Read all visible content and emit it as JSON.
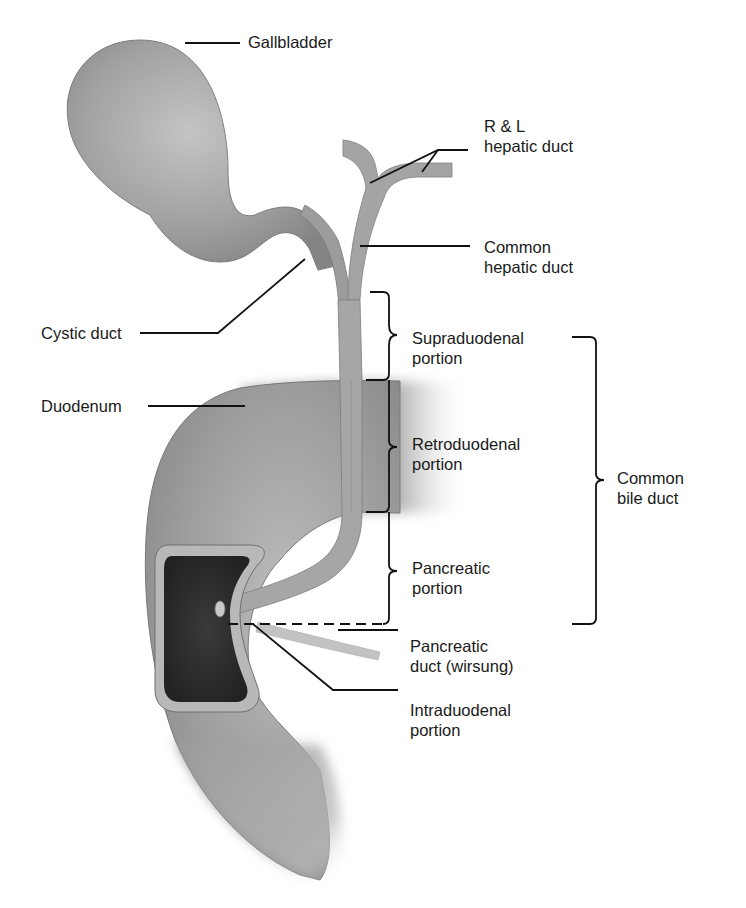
{
  "figure": {
    "type": "anatomical-diagram",
    "colors": {
      "background": "#ffffff",
      "organ_mid": "#9a9a9a",
      "organ_light": "#bdbdbd",
      "organ_dark": "#7a7a7a",
      "papilla_dark": "#2c2c2c",
      "papilla_rim": "#b8b8b8",
      "leader_line": "#111111",
      "text": "#1a1a1a"
    }
  },
  "labels": {
    "gallbladder": {
      "lines": [
        "Gallbladder"
      ]
    },
    "rl_hepatic_duct": {
      "lines": [
        "R & L",
        "hepatic duct"
      ]
    },
    "common_hepatic_duct": {
      "lines": [
        "Common",
        "hepatic duct"
      ]
    },
    "cystic_duct": {
      "lines": [
        "Cystic duct"
      ]
    },
    "supraduodenal": {
      "lines": [
        "Supraduodenal",
        "portion"
      ]
    },
    "duodenum": {
      "lines": [
        "Duodenum"
      ]
    },
    "retroduodenal": {
      "lines": [
        "Retroduodenal",
        "portion"
      ]
    },
    "common_bile_duct": {
      "lines": [
        "Common",
        "bile duct"
      ]
    },
    "pancreatic_portion": {
      "lines": [
        "Pancreatic",
        "portion"
      ]
    },
    "pancreatic_duct": {
      "lines": [
        "Pancreatic",
        "duct (wirsung)"
      ]
    },
    "intraduodenal": {
      "lines": [
        "Intraduodenal",
        "portion"
      ]
    }
  }
}
